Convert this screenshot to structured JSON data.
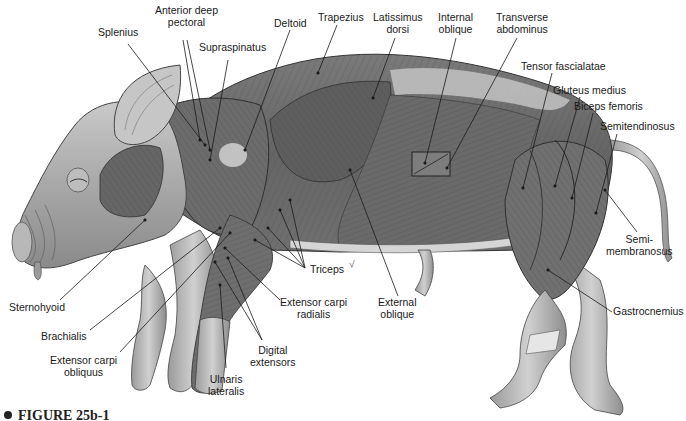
{
  "figure": {
    "caption": "FIGURE 25b-1"
  },
  "labels": [
    {
      "id": "splenius",
      "text": "Splenius",
      "x": 98,
      "y": 27
    },
    {
      "id": "anterior-deep-pectoral",
      "text": "Anterior deep\npectoral",
      "x": 155,
      "y": 5
    },
    {
      "id": "supraspinatus",
      "text": "Supraspinatus",
      "x": 199,
      "y": 42
    },
    {
      "id": "deltoid",
      "text": "Deltoid",
      "x": 274,
      "y": 18
    },
    {
      "id": "trapezius",
      "text": "Trapezius",
      "x": 318,
      "y": 12
    },
    {
      "id": "latissimus-dorsi",
      "text": "Latissimus\ndorsi",
      "x": 373,
      "y": 12
    },
    {
      "id": "internal-oblique",
      "text": "Internal\noblique",
      "x": 438,
      "y": 12
    },
    {
      "id": "transverse-abdominus",
      "text": "Transverse\nabdominus",
      "x": 496,
      "y": 12
    },
    {
      "id": "tensor-fascialatae",
      "text": "Tensor fascialatae",
      "x": 521,
      "y": 61
    },
    {
      "id": "gluteus-medius",
      "text": "Gluteus medius",
      "x": 553,
      "y": 85
    },
    {
      "id": "biceps-femoris",
      "text": "Biceps femoris",
      "x": 574,
      "y": 101
    },
    {
      "id": "semitendinosus",
      "text": "Semitendinosus",
      "x": 600,
      "y": 121
    },
    {
      "id": "semimembranosus",
      "text": "Semi-\nmembranosus",
      "x": 606,
      "y": 234
    },
    {
      "id": "gastrocnemius",
      "text": "Gastrocnemius",
      "x": 613,
      "y": 306
    },
    {
      "id": "sternohyoid",
      "text": "Sternohyoid",
      "x": 9,
      "y": 302
    },
    {
      "id": "brachialis",
      "text": "Brachialis",
      "x": 41,
      "y": 331
    },
    {
      "id": "extensor-carpi-obliquus",
      "text": "Extensor carpi\nobliquus",
      "x": 50,
      "y": 355
    },
    {
      "id": "triceps",
      "text": "Triceps",
      "x": 310,
      "y": 264
    },
    {
      "id": "extensor-carpi-radialis",
      "text": "Extensor carpi\nradialis",
      "x": 280,
      "y": 297
    },
    {
      "id": "external-oblique",
      "text": "External\noblique",
      "x": 378,
      "y": 297
    },
    {
      "id": "digital-extensors",
      "text": "Digital\nextensors",
      "x": 250,
      "y": 345
    },
    {
      "id": "ulnaris-lateralis",
      "text": "Ulnaris\nlateralis",
      "x": 208,
      "y": 374
    }
  ],
  "leaders": [
    [
      128,
      44,
      205,
      145
    ],
    [
      183,
      40,
      200,
      140
    ],
    [
      187,
      40,
      210,
      150
    ],
    [
      228,
      60,
      210,
      160
    ],
    [
      290,
      30,
      245,
      150
    ],
    [
      337,
      25,
      318,
      73
    ],
    [
      395,
      38,
      373,
      98
    ],
    [
      456,
      38,
      425,
      163
    ],
    [
      517,
      38,
      447,
      168
    ],
    [
      552,
      73,
      523,
      188
    ],
    [
      580,
      97,
      555,
      186
    ],
    [
      593,
      113,
      572,
      198
    ],
    [
      617,
      134,
      596,
      213
    ],
    [
      637,
      232,
      605,
      190
    ],
    [
      612,
      312,
      548,
      270
    ],
    [
      60,
      300,
      145,
      220
    ],
    [
      90,
      330,
      220,
      228
    ],
    [
      120,
      352,
      230,
      233
    ],
    [
      305,
      268,
      280,
      210
    ],
    [
      305,
      268,
      268,
      228
    ],
    [
      305,
      268,
      255,
      240
    ],
    [
      305,
      268,
      290,
      200
    ],
    [
      280,
      300,
      225,
      248
    ],
    [
      398,
      296,
      350,
      170
    ],
    [
      262,
      340,
      215,
      262
    ],
    [
      262,
      340,
      228,
      258
    ],
    [
      226,
      368,
      220,
      285
    ]
  ],
  "marks": {
    "triceps_check": "√"
  }
}
